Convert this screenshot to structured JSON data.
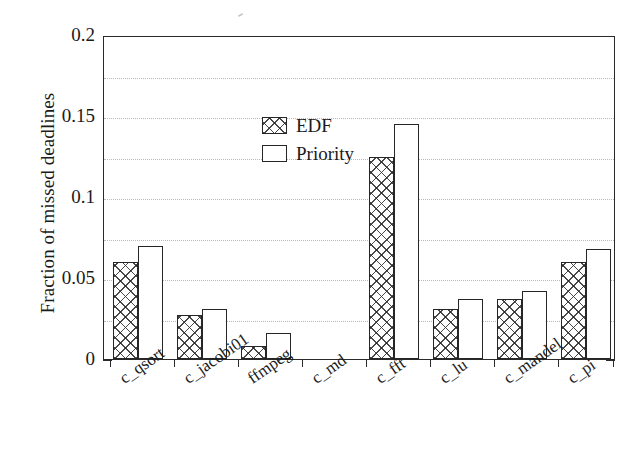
{
  "chart_data": {
    "type": "bar",
    "title": "",
    "xlabel": "",
    "ylabel": "Fraction of missed deadlines",
    "ylim": [
      0,
      0.2
    ],
    "xlim": [
      0,
      8
    ],
    "grid": true,
    "grid_axis": "y",
    "legend_position": "upper left",
    "y_major_ticks": [
      0,
      0.05,
      0.1,
      0.15,
      0.2
    ],
    "y_major_tick_labels": [
      "0",
      "0.05",
      "0.1",
      "0.15",
      "0.2"
    ],
    "y_minor_ticks": [
      0.025,
      0.075,
      0.125,
      0.175
    ],
    "categories": [
      "c_qsort",
      "c_jacobi01",
      "ffmpeg",
      "c_md",
      "c_fft",
      "c_lu",
      "c_mandel",
      "c_pi"
    ],
    "series": [
      {
        "name": "EDF",
        "fill": "crosshatch",
        "values": [
          0.06,
          0.027,
          0.008,
          0.0,
          0.125,
          0.031,
          0.037,
          0.06
        ]
      },
      {
        "name": "Priority",
        "fill": "white",
        "values": [
          0.07,
          0.031,
          0.016,
          0.0,
          0.145,
          0.037,
          0.042,
          0.068
        ]
      }
    ]
  },
  "axes": {
    "y_title": "Fraction of missed deadlines"
  },
  "legend": {
    "entries": [
      {
        "label": "EDF"
      },
      {
        "label": "Priority"
      }
    ]
  },
  "colors": {
    "axis": "#2a2a2a",
    "grid": "#b9b9b9",
    "bar_edge": "#262626",
    "bar_fill": "#ffffff",
    "hatch": "#282828",
    "text": "#1b1b1b",
    "background": "#ffffff"
  }
}
